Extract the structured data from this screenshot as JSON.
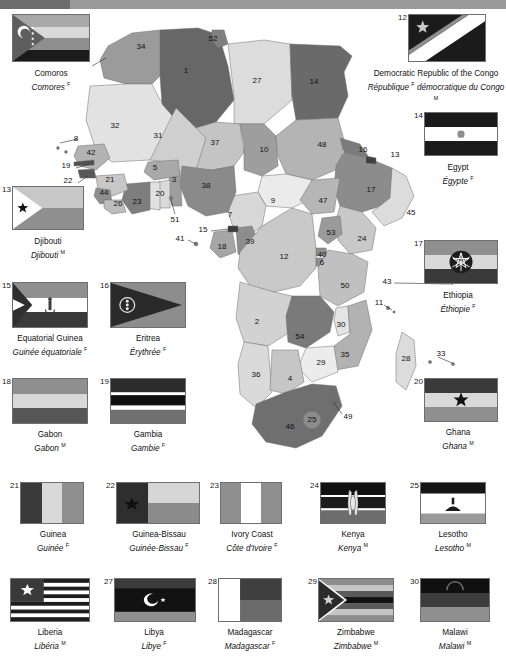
{
  "page": {
    "language_note": {
      "masculine": "M",
      "feminine": "F"
    }
  },
  "flags": [
    {
      "num": "11",
      "en": "Comoros",
      "fr": "Comores",
      "gender": "F",
      "x": 12,
      "y": 14,
      "w": 78,
      "h": 48,
      "label_y": 66,
      "label_w": 98,
      "label_x": 2,
      "num_inset": true
    },
    {
      "num": "12",
      "en": "Democratic Republic of the Congo",
      "fr": "République <i>F</i> démocratique du Congo",
      "gender": "M",
      "x": 408,
      "y": 14,
      "w": 78,
      "h": 48,
      "label_y": 66,
      "label_w": 140,
      "label_x": 366,
      "num_inset": false
    },
    {
      "num": "14",
      "en": "Egypt",
      "fr": "Égypte",
      "gender": "F",
      "x": 424,
      "y": 112,
      "w": 74,
      "h": 44,
      "label_y": 160,
      "label_w": 96,
      "label_x": 410,
      "num_inset": false
    },
    {
      "num": "13",
      "en": "Djibouti",
      "fr": "Djibouti",
      "gender": "M",
      "x": 12,
      "y": 186,
      "w": 72,
      "h": 44,
      "label_y": 234,
      "label_w": 96,
      "label_x": 0,
      "num_inset": false
    },
    {
      "num": "17",
      "en": "Ethiopia",
      "fr": "Éthiopie",
      "gender": "F",
      "x": 424,
      "y": 240,
      "w": 74,
      "h": 44,
      "label_y": 288,
      "label_w": 96,
      "label_x": 410,
      "num_inset": false
    },
    {
      "num": "15",
      "en": "Equatorial Guinea",
      "fr": "Guinée équatoriale",
      "gender": "F",
      "x": 12,
      "y": 282,
      "w": 76,
      "h": 46,
      "label_y": 331,
      "label_w": 104,
      "label_x": -2,
      "num_inset": false
    },
    {
      "num": "16",
      "en": "Eritrea",
      "fr": "Érythrée",
      "gender": "F",
      "x": 110,
      "y": 282,
      "w": 76,
      "h": 46,
      "label_y": 331,
      "label_w": 100,
      "label_x": 98,
      "num_inset": false
    },
    {
      "num": "18",
      "en": "Gabon",
      "fr": "Gabon",
      "gender": "M",
      "x": 12,
      "y": 378,
      "w": 76,
      "h": 46,
      "label_y": 427,
      "label_w": 100,
      "label_x": 0,
      "num_inset": false
    },
    {
      "num": "19",
      "en": "Gambia",
      "fr": "Gambie",
      "gender": "F",
      "x": 110,
      "y": 378,
      "w": 76,
      "h": 46,
      "label_y": 427,
      "label_w": 100,
      "label_x": 98,
      "num_inset": false
    },
    {
      "num": "20",
      "en": "Ghana",
      "fr": "Ghana",
      "gender": "M",
      "x": 424,
      "y": 378,
      "w": 74,
      "h": 44,
      "label_y": 425,
      "label_w": 96,
      "label_x": 410,
      "num_inset": false
    },
    {
      "num": "21",
      "en": "Guinea",
      "fr": "Guinée",
      "gender": "F",
      "x": 20,
      "y": 482,
      "w": 64,
      "h": 42,
      "label_y": 527,
      "label_w": 90,
      "label_x": 8,
      "num_inset": false
    },
    {
      "num": "22",
      "en": "Guinea-Bissau",
      "fr": "Guinée-Bissau",
      "gender": "F",
      "x": 116,
      "y": 482,
      "w": 84,
      "h": 42,
      "label_y": 527,
      "label_w": 110,
      "label_x": 104,
      "num_inset": false
    },
    {
      "num": "23",
      "en": "Ivory Coast",
      "fr": "Côte d'Ivoire",
      "gender": "F",
      "x": 220,
      "y": 482,
      "w": 62,
      "h": 42,
      "label_y": 527,
      "label_w": 92,
      "label_x": 206,
      "num_inset": false
    },
    {
      "num": "24",
      "en": "Kenya",
      "fr": "Kenya",
      "gender": "M",
      "x": 320,
      "y": 482,
      "w": 66,
      "h": 42,
      "label_y": 527,
      "label_w": 90,
      "label_x": 308,
      "num_inset": false
    },
    {
      "num": "25",
      "en": "Lesotho",
      "fr": "Lesotho",
      "gender": "M",
      "x": 420,
      "y": 482,
      "w": 66,
      "h": 42,
      "label_y": 527,
      "label_w": 90,
      "label_x": 408,
      "num_inset": false
    },
    {
      "num": "26",
      "en": "Liberia",
      "fr": "Libéria",
      "gender": "M",
      "x": 10,
      "y": 578,
      "w": 80,
      "h": 44,
      "label_y": 625,
      "label_w": 96,
      "label_x": 2,
      "num_inset": true
    },
    {
      "num": "27",
      "en": "Libya",
      "fr": "Libye",
      "gender": "F",
      "x": 114,
      "y": 578,
      "w": 82,
      "h": 44,
      "label_y": 625,
      "label_w": 96,
      "label_x": 106,
      "num_inset": false
    },
    {
      "num": "28",
      "en": "Madagascar",
      "fr": "Madagascar",
      "gender": "F",
      "x": 218,
      "y": 578,
      "w": 64,
      "h": 44,
      "label_y": 625,
      "label_w": 100,
      "label_x": 200,
      "num_inset": false
    },
    {
      "num": "29",
      "en": "Zimbabwe",
      "fr": "Zimbabwe",
      "gender": "M",
      "x": 318,
      "y": 578,
      "w": 76,
      "h": 44,
      "label_y": 625,
      "label_w": 96,
      "label_x": 308,
      "num_inset": false
    },
    {
      "num": "30",
      "en": "Malawi",
      "fr": "Malawi",
      "gender": "M",
      "x": 420,
      "y": 578,
      "w": 70,
      "h": 44,
      "label_y": 625,
      "label_w": 90,
      "label_x": 410,
      "num_inset": false
    }
  ],
  "map_labels": [
    {
      "n": "34",
      "x": 141,
      "y": 47
    },
    {
      "n": "52",
      "x": 213,
      "y": 39
    },
    {
      "n": "1",
      "x": 186,
      "y": 71
    },
    {
      "n": "27",
      "x": 257,
      "y": 81
    },
    {
      "n": "14",
      "x": 314,
      "y": 82
    },
    {
      "n": "32",
      "x": 115,
      "y": 126
    },
    {
      "n": "31",
      "x": 158,
      "y": 136
    },
    {
      "n": "37",
      "x": 215,
      "y": 143
    },
    {
      "n": "10",
      "x": 264,
      "y": 150
    },
    {
      "n": "48",
      "x": 322,
      "y": 145
    },
    {
      "n": "16",
      "x": 363,
      "y": 150
    },
    {
      "n": "13",
      "x": 395,
      "y": 155
    },
    {
      "n": "8",
      "x": 76,
      "y": 139
    },
    {
      "n": "42",
      "x": 91,
      "y": 153
    },
    {
      "n": "19",
      "x": 66,
      "y": 166
    },
    {
      "n": "22",
      "x": 68,
      "y": 181
    },
    {
      "n": "21",
      "x": 110,
      "y": 180
    },
    {
      "n": "44",
      "x": 104,
      "y": 193
    },
    {
      "n": "26",
      "x": 118,
      "y": 204
    },
    {
      "n": "23",
      "x": 137,
      "y": 202
    },
    {
      "n": "5",
      "x": 155,
      "y": 168
    },
    {
      "n": "3",
      "x": 174,
      "y": 180
    },
    {
      "n": "20",
      "x": 160,
      "y": 194
    },
    {
      "n": "38",
      "x": 206,
      "y": 186
    },
    {
      "n": "17",
      "x": 371,
      "y": 190
    },
    {
      "n": "47",
      "x": 323,
      "y": 201
    },
    {
      "n": "9",
      "x": 273,
      "y": 201
    },
    {
      "n": "7",
      "x": 230,
      "y": 215
    },
    {
      "n": "51",
      "x": 175,
      "y": 220
    },
    {
      "n": "45",
      "x": 411,
      "y": 213
    },
    {
      "n": "41",
      "x": 180,
      "y": 239
    },
    {
      "n": "15",
      "x": 203,
      "y": 230
    },
    {
      "n": "18",
      "x": 222,
      "y": 247
    },
    {
      "n": "39",
      "x": 250,
      "y": 242
    },
    {
      "n": "53",
      "x": 331,
      "y": 233
    },
    {
      "n": "24",
      "x": 362,
      "y": 239
    },
    {
      "n": "12",
      "x": 284,
      "y": 257
    },
    {
      "n": "40",
      "x": 322,
      "y": 255
    },
    {
      "n": "6",
      "x": 322,
      "y": 263
    },
    {
      "n": "50",
      "x": 345,
      "y": 286
    },
    {
      "n": "43",
      "x": 387,
      "y": 282
    },
    {
      "n": "11",
      "x": 379,
      "y": 303
    },
    {
      "n": "2",
      "x": 257,
      "y": 322
    },
    {
      "n": "54",
      "x": 300,
      "y": 337
    },
    {
      "n": "30",
      "x": 341,
      "y": 325
    },
    {
      "n": "35",
      "x": 345,
      "y": 355
    },
    {
      "n": "29",
      "x": 321,
      "y": 363
    },
    {
      "n": "36",
      "x": 256,
      "y": 375
    },
    {
      "n": "4",
      "x": 290,
      "y": 379
    },
    {
      "n": "28",
      "x": 406,
      "y": 359
    },
    {
      "n": "33",
      "x": 441,
      "y": 354
    },
    {
      "n": "46",
      "x": 290,
      "y": 427
    },
    {
      "n": "25",
      "x": 312,
      "y": 420
    },
    {
      "n": "49",
      "x": 348,
      "y": 417
    }
  ]
}
